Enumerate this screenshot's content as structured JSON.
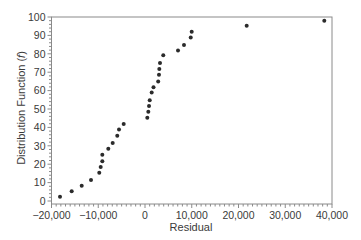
{
  "chart_data": {
    "type": "scatter",
    "title": "",
    "xlabel": "Residual",
    "ylabel": "Distribution  Function (f)",
    "ylabel_parts": {
      "prefix": "Distribution  Function (",
      "italic": "f",
      "suffix": ")"
    },
    "xlim": [
      -20000,
      40000
    ],
    "ylim": [
      0,
      100
    ],
    "x_ticks": [
      -20000,
      -10000,
      0,
      10000,
      20000,
      30000,
      40000
    ],
    "x_tick_labels": [
      "−20,000",
      "−10,000",
      "0",
      "10,000",
      "20,000",
      "30,000",
      "40,000"
    ],
    "y_ticks": [
      0,
      10,
      20,
      30,
      40,
      50,
      60,
      70,
      80,
      90,
      100
    ],
    "y_tick_labels": [
      "0",
      "10",
      "20",
      "30",
      "40",
      "50",
      "60",
      "70",
      "80",
      "90",
      "100"
    ],
    "x_minor_step": 1000,
    "y_minor_step": 2,
    "grid": false,
    "legend": null,
    "marker_color": "#2b2b2b",
    "series": [
      {
        "name": "Residuals",
        "points": [
          [
            -18180,
            2.3
          ],
          [
            -15680,
            5.3
          ],
          [
            -13540,
            8.3
          ],
          [
            -11550,
            11.4
          ],
          [
            -9780,
            15.4
          ],
          [
            -9480,
            18.5
          ],
          [
            -9130,
            21.6
          ],
          [
            -9130,
            25.2
          ],
          [
            -7850,
            28.4
          ],
          [
            -6910,
            31.5
          ],
          [
            -5930,
            35.5
          ],
          [
            -5560,
            38.8
          ],
          [
            -4560,
            41.8
          ],
          [
            490,
            45.3
          ],
          [
            710,
            48.5
          ],
          [
            860,
            51.6
          ],
          [
            1010,
            54.7
          ],
          [
            1430,
            58.9
          ],
          [
            1820,
            61.8
          ],
          [
            2820,
            65.0
          ],
          [
            2990,
            68.6
          ],
          [
            3060,
            71.7
          ],
          [
            3210,
            75.0
          ],
          [
            3910,
            79.2
          ],
          [
            7060,
            81.8
          ],
          [
            8340,
            84.8
          ],
          [
            9780,
            88.8
          ],
          [
            9990,
            92.0
          ],
          [
            21750,
            95.2
          ],
          [
            38350,
            97.9
          ]
        ]
      }
    ]
  }
}
